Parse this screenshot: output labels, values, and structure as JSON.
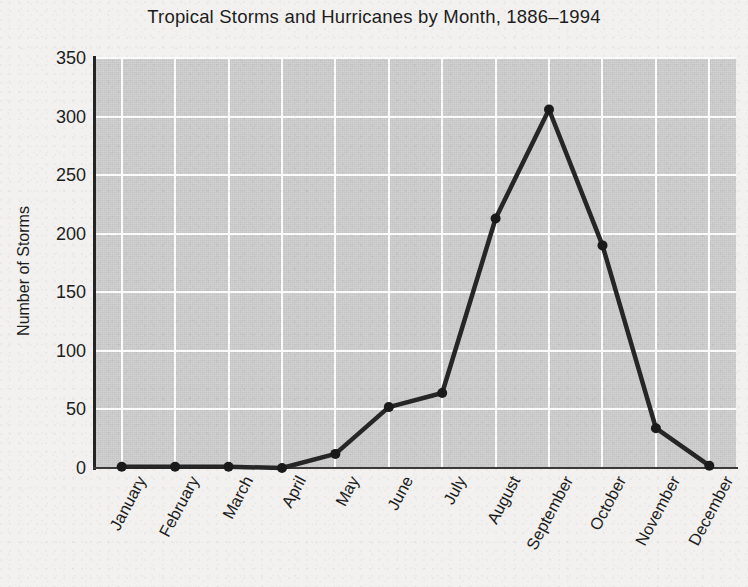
{
  "chart_data": {
    "type": "line",
    "title": "Tropical Storms and Hurricanes by Month, 1886–1994",
    "xlabel": "",
    "ylabel": "Number of Storms",
    "categories": [
      "January",
      "February",
      "March",
      "April",
      "May",
      "June",
      "July",
      "August",
      "September",
      "October",
      "November",
      "December"
    ],
    "values": [
      1,
      1,
      1,
      0,
      12,
      52,
      64,
      213,
      306,
      190,
      34,
      2
    ],
    "series": [
      {
        "name": "Number of Storms",
        "values": [
          1,
          1,
          1,
          0,
          12,
          52,
          64,
          213,
          306,
          190,
          34,
          2
        ]
      }
    ],
    "ylim": [
      0,
      350
    ],
    "ytick_labels": [
      "350",
      "300",
      "250",
      "200",
      "150",
      "100",
      "50",
      "0"
    ],
    "ytick_values": [
      350,
      300,
      250,
      200,
      150,
      100,
      50,
      0
    ],
    "grid": true,
    "grid_color": "#fbfbfb",
    "plot_background": "#c9c9c9",
    "figure_background": "#f2f1ef",
    "line_color": "#262626",
    "marker_color": "#1a1a1a",
    "marker_shape": "circle",
    "legend": "none",
    "xtick_rotation": -62
  }
}
